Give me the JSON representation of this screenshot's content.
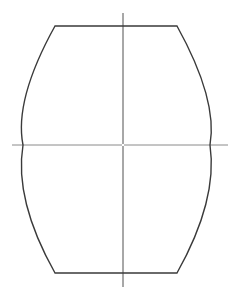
{
  "diagram": {
    "shape": {
      "name": "barrel-outline",
      "top_edge": "flat",
      "bottom_edge": "flat",
      "sides": "convex-arcs"
    },
    "axes": [
      {
        "name": "vertical-axis",
        "orientation": "vertical"
      },
      {
        "name": "horizontal-axis",
        "orientation": "horizontal"
      }
    ],
    "colors": {
      "outline": "#3a3a3a",
      "vertical_axis": "#505050",
      "horizontal_axis": "#8a8a8a",
      "background": "#ffffff"
    },
    "labels": []
  }
}
